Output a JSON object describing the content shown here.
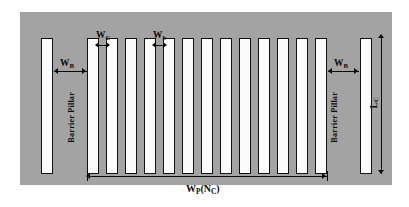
{
  "figure": {
    "background_color": "#a3a3a3",
    "pillar_fill": "#fbfbfb",
    "pillar_stroke": "#111111"
  },
  "labels": {
    "barrier_pillar_left": "Barrier Pillar",
    "barrier_pillar_right": "Barrier Pillar",
    "w_c": "W",
    "w_c_sub": "C",
    "w_b_small": "W",
    "w_b_small_sub": "b",
    "w_barrier_left": "W",
    "w_barrier_left_sub": "B",
    "w_barrier_right": "W",
    "w_barrier_right_sub": "B",
    "w_panel": "W",
    "w_panel_sub": "P",
    "w_panel_count_open": "(N",
    "w_panel_count_sub": "C",
    "w_panel_count_close": ")",
    "l_c": "L",
    "l_c_sub": "C"
  },
  "geometry": {
    "panel": {
      "x": 20,
      "y": 12,
      "width": 372,
      "height": 173
    },
    "pillar_count_total": 15,
    "pillar_count_inner": 13,
    "pillar_count_barrier": 2,
    "pillars": [
      {
        "id": "barrier-left",
        "x": 41,
        "y": 38,
        "width": 12,
        "height": 136,
        "type": "barrier"
      },
      {
        "id": "inner-1",
        "x": 87,
        "y": 38,
        "width": 12,
        "height": 136,
        "type": "chain"
      },
      {
        "id": "inner-2",
        "x": 106,
        "y": 38,
        "width": 12,
        "height": 136,
        "type": "chain"
      },
      {
        "id": "inner-3",
        "x": 125,
        "y": 38,
        "width": 12,
        "height": 136,
        "type": "chain"
      },
      {
        "id": "inner-4",
        "x": 144,
        "y": 38,
        "width": 12,
        "height": 136,
        "type": "chain"
      },
      {
        "id": "inner-5",
        "x": 163,
        "y": 38,
        "width": 12,
        "height": 136,
        "type": "chain"
      },
      {
        "id": "inner-6",
        "x": 182,
        "y": 38,
        "width": 12,
        "height": 136,
        "type": "chain"
      },
      {
        "id": "inner-7",
        "x": 201,
        "y": 38,
        "width": 12,
        "height": 136,
        "type": "chain"
      },
      {
        "id": "inner-8",
        "x": 220,
        "y": 38,
        "width": 12,
        "height": 136,
        "type": "chain"
      },
      {
        "id": "inner-9",
        "x": 239,
        "y": 38,
        "width": 12,
        "height": 136,
        "type": "chain"
      },
      {
        "id": "inner-10",
        "x": 258,
        "y": 38,
        "width": 12,
        "height": 136,
        "type": "chain"
      },
      {
        "id": "inner-11",
        "x": 277,
        "y": 38,
        "width": 12,
        "height": 136,
        "type": "chain"
      },
      {
        "id": "inner-12",
        "x": 296,
        "y": 38,
        "width": 12,
        "height": 136,
        "type": "chain"
      },
      {
        "id": "inner-13",
        "x": 315,
        "y": 38,
        "width": 12,
        "height": 136,
        "type": "chain"
      },
      {
        "id": "barrier-right",
        "x": 360,
        "y": 38,
        "width": 12,
        "height": 136,
        "type": "barrier"
      }
    ],
    "dimensions": {
      "w_barrier_left": {
        "x1": 54,
        "x2": 87,
        "y": 71
      },
      "w_barrier_right": {
        "x1": 328,
        "x2": 359,
        "y": 71
      },
      "w_c": {
        "x1": 99,
        "x2": 106,
        "y": 45
      },
      "w_b_small": {
        "x1": 156,
        "x2": 163,
        "y": 45
      },
      "w_panel": {
        "x1": 87,
        "x2": 327,
        "y": 176
      },
      "l_c": {
        "y1": 38,
        "y2": 174,
        "x": 381
      }
    }
  }
}
